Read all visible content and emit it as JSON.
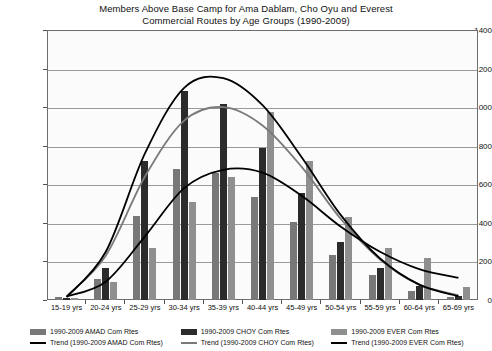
{
  "chart_data": {
    "type": "bar",
    "title": "Members Above Base Camp for Ama Dablam, Cho Oyu and Everest\nCommercial Routes by Age Groups (1990-2009)",
    "title_line1": "Members Above Base Camp for Ama Dablam, Cho Oyu and Everest",
    "title_line2": "Commercial Routes by Age Groups (1990-2009)",
    "xlabel": "",
    "ylabel": "",
    "ylim": [
      0,
      1400
    ],
    "yticks": [
      0,
      200,
      400,
      600,
      800,
      1000,
      1200,
      1400
    ],
    "ytick_labels": [
      "0",
      "200",
      "400",
      "600",
      "800",
      "1000",
      "1200",
      "1400"
    ],
    "grid": true,
    "legend_position": "bottom",
    "categories": [
      "15-19 yrs",
      "20-24 yrs",
      "25-29 yrs",
      "30-34 yrs",
      "35-39 yrs",
      "40-44 yrs",
      "45-49 yrs",
      "50-54 yrs",
      "55-59 yrs",
      "60-64 yrs",
      "65-69 yrs"
    ],
    "series": [
      {
        "name": "1990-2009 AMAD Com Rtes",
        "color": "#787878",
        "values": [
          18,
          110,
          435,
          680,
          660,
          535,
          405,
          235,
          130,
          45,
          15
        ]
      },
      {
        "name": "1990-2009 CHOY Com Rtes",
        "color": "#2b2b2b",
        "values": [
          10,
          165,
          720,
          1085,
          1015,
          790,
          555,
          300,
          165,
          75,
          20
        ]
      },
      {
        "name": "1990-2009 EVER Com Rtes",
        "color": "#8f8f8f",
        "values": [
          12,
          95,
          270,
          510,
          640,
          975,
          720,
          430,
          270,
          220,
          70
        ]
      }
    ],
    "trends": [
      {
        "name": "Trend (1990-2009 AMAD Com Rtes)",
        "color": "#7a7a7a",
        "values": [
          20,
          230,
          640,
          930,
          1000,
          905,
          690,
          420,
          210,
          80,
          25
        ]
      },
      {
        "name": "Trend (1990-2009 CHOY Com Rtes)",
        "color": "#000000",
        "values": [
          15,
          250,
          760,
          1100,
          1150,
          1010,
          740,
          440,
          215,
          80,
          20
        ]
      },
      {
        "name": "Trend (1990-2009 EVER Com Rtes)",
        "color": "#000000",
        "values": [
          18,
          95,
          330,
          580,
          675,
          660,
          540,
          380,
          250,
          160,
          115
        ]
      }
    ]
  },
  "legend": {
    "entries": [
      {
        "label": "1990-2009 AMAD Com Rtes",
        "trend_label": "Trend (1990-2009 AMAD Com Rtes)"
      },
      {
        "label": "1990-2009 CHOY Com Rtes",
        "trend_label": "Trend (1990-2009 CHOY Com Rtes)"
      },
      {
        "label": "1990-2009 EVER Com Rtes",
        "trend_label": "Trend (1990-2009 EVER Com Rtes)"
      }
    ]
  }
}
